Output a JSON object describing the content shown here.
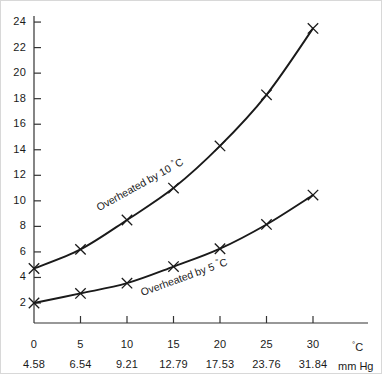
{
  "chart_data": {
    "type": "line",
    "title": "",
    "xlabel": "°C",
    "ylabel": "",
    "x": [
      0,
      5,
      10,
      15,
      20,
      25,
      30
    ],
    "xtick_labels": [
      "0",
      "5",
      "10",
      "15",
      "20",
      "25",
      "30"
    ],
    "xtick_labels_secondary": [
      "4.58",
      "6.54",
      "9.21",
      "12.79",
      "17.53",
      "23.76",
      "31.84"
    ],
    "secondary_axis_unit": "mm Hg",
    "primary_axis_unit": "°C",
    "ytick_labels": [
      "2",
      "4",
      "6",
      "8",
      "10",
      "12",
      "14",
      "16",
      "18",
      "20",
      "22",
      "24"
    ],
    "ytick_values": [
      2,
      4,
      6,
      8,
      10,
      12,
      14,
      16,
      18,
      20,
      22,
      24
    ],
    "ylim": [
      0,
      25
    ],
    "xlim": [
      0,
      32
    ],
    "grid": false,
    "legend_position": "inline-along-curves",
    "marker": "x",
    "series": [
      {
        "name": "Overheated by 10 °C",
        "label_text": "Overheated by 10",
        "label_degree": "°",
        "label_unit": "C",
        "values": [
          4.7,
          6.2,
          8.5,
          11.0,
          14.3,
          18.3,
          23.5
        ],
        "color": "#1a1a1a"
      },
      {
        "name": "Overheated by 5 °C",
        "label_text": "Overheated by 5",
        "label_degree": "°",
        "label_unit": "C",
        "values": [
          2.0,
          2.75,
          3.55,
          4.85,
          6.25,
          8.15,
          10.45
        ],
        "color": "#1a1a1a"
      }
    ]
  },
  "axes": {
    "y_axis_name": "y-axis",
    "x_axis_name": "x-axis",
    "secondary_row_name": "vapour-pressure-row"
  }
}
